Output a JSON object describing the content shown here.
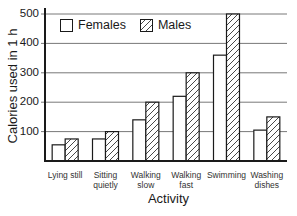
{
  "chart_data": {
    "type": "bar",
    "title": "",
    "xlabel": "Activity",
    "ylabel": "Calories used in 1 h",
    "ylim": [
      0,
      500
    ],
    "yticks": [
      100,
      200,
      300,
      400,
      500
    ],
    "grid": true,
    "legend_position": "upper left (inside)",
    "categories": [
      "Lying still",
      "Sitting quietly",
      "Walking slow",
      "Walking fast",
      "Swimming",
      "Washing dishes"
    ],
    "category_lines": [
      [
        "Lying still"
      ],
      [
        "Sitting",
        "quietly"
      ],
      [
        "Walking",
        "slow"
      ],
      [
        "Walking",
        "fast"
      ],
      [
        "Swimming"
      ],
      [
        "Washing",
        "dishes"
      ]
    ],
    "series": [
      {
        "name": "Females",
        "pattern": "plain",
        "values": [
          55,
          75,
          140,
          220,
          360,
          105
        ]
      },
      {
        "name": "Males",
        "pattern": "hatched",
        "values": [
          75,
          100,
          200,
          300,
          500,
          150
        ]
      }
    ]
  },
  "legend": {
    "females_label": "Females",
    "males_label": "Males"
  },
  "axis": {
    "ylabel": "Calories used in 1 h",
    "xlabel": "Activity",
    "tick_labels": [
      "500",
      "400",
      "300",
      "200",
      "100"
    ]
  },
  "colors": {
    "ink": "#1a1a1a",
    "background": "#ffffff"
  }
}
